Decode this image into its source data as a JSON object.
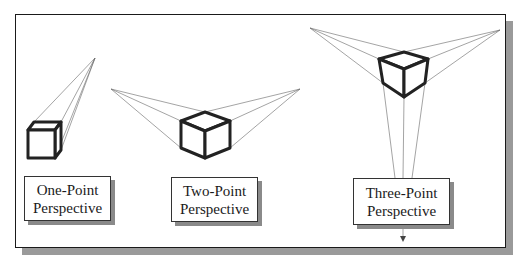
{
  "figure": {
    "panels": [
      {
        "id": "one-point",
        "label_line1": "One-Point",
        "label_line2": "Perspective",
        "vanishing_points": [
          [
            95,
            58
          ]
        ]
      },
      {
        "id": "two-point",
        "label_line1": "Two-Point",
        "label_line2": "Perspective",
        "vanishing_points": [
          [
            111,
            89
          ],
          [
            300,
            89
          ]
        ]
      },
      {
        "id": "three-point",
        "label_line1": "Three-Point",
        "label_line2": "Perspective",
        "vanishing_points": [
          [
            310,
            28
          ],
          [
            500,
            30
          ],
          [
            403,
            262
          ]
        ]
      }
    ]
  },
  "colors": {
    "frame_border": "#1a1a1a",
    "shadow": "#9a9a9a",
    "cube_stroke": "#222222",
    "construction_line": "#666666"
  }
}
